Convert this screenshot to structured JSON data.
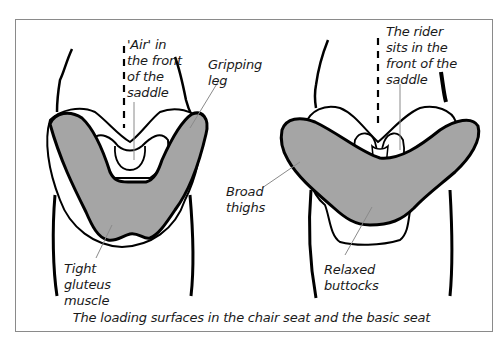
{
  "colors": {
    "load_surface_fill": "#a5a5a5",
    "outline": "#000000",
    "leader_line": "#8a8a8a",
    "frame_border": "#8a8a8a",
    "background": "#ffffff"
  },
  "diagrams": [
    {
      "id": "chair-seat",
      "labels": {
        "air_front": "'Air' in\nthe front\nof the\nsaddle",
        "gripping_leg": "Gripping\nleg",
        "gluteus": "Tight\ngluteus\nmuscle"
      }
    },
    {
      "id": "basic-seat",
      "labels": {
        "rider_front": "The rider\nsits in the\nfront of the\nsaddle",
        "broad_thighs": "Broad\nthighs",
        "buttocks": "Relaxed\nbuttocks"
      }
    }
  ],
  "caption": "The loading surfaces in the chair seat and the basic seat"
}
